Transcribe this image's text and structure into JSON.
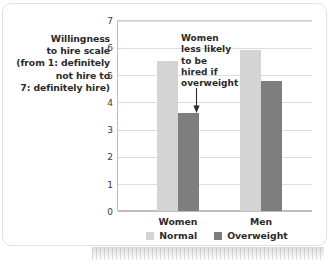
{
  "chart_data": {
    "type": "bar",
    "title": "",
    "subtitle": "",
    "xlabel": "",
    "ylabel": "Willingness to hire scale (from 1: definitely not hire to 7: definitely hire)",
    "ylabel_lines": [
      "Willingness",
      "to hire scale",
      "(from 1: definitely",
      "not hire to",
      "7: definitely hire)"
    ],
    "categories": [
      "Women",
      "Men"
    ],
    "series": [
      {
        "name": "Normal",
        "values": [
          5.5,
          5.9
        ],
        "color": "#d4d4d4"
      },
      {
        "name": "Overweight",
        "values": [
          3.6,
          4.75
        ],
        "color": "#7e7e7e"
      }
    ],
    "ylim": [
      0,
      7
    ],
    "yticks": [
      7,
      6,
      5,
      4,
      3,
      2,
      1,
      0
    ],
    "ytick_labels": [
      "7",
      "6",
      "5",
      "4",
      "3",
      "2",
      "1",
      "0"
    ],
    "grid": true,
    "legend_position": "bottom-center",
    "annotations": [
      {
        "text": "Women less likely to be hired if overweight",
        "lines": [
          "Women",
          "less likely",
          "to be",
          "hired if",
          "overweight"
        ],
        "arrow": "down-arrow",
        "points_to": "women-overweight-bar"
      }
    ]
  },
  "legend": {
    "items": [
      {
        "label": "Normal",
        "color": "#d4d4d4",
        "swatch": "normal-swatch"
      },
      {
        "label": "Overweight",
        "color": "#7e7e7e",
        "swatch": "overweight-swatch"
      }
    ]
  },
  "colors": {
    "normal": "#d4d4d4",
    "overweight": "#7e7e7e",
    "grid": "#dcdcdc",
    "axis": "#bdbdbd",
    "text": "#2b2b2b",
    "card_border": "#e2e2e2"
  }
}
